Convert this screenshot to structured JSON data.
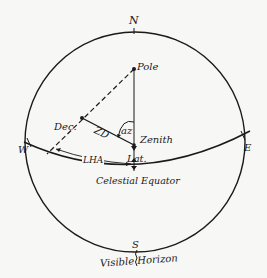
{
  "diagram": {
    "type": "celestial-sphere-navigational-triangle",
    "cardinal": {
      "north": "N",
      "south": "S",
      "west": "W",
      "east": "E"
    },
    "points": {
      "pole": "Pole",
      "zenith": "Zenith",
      "declination": "Dec.",
      "latitude": "Lat."
    },
    "arcs": {
      "zenith_distance": "ZD",
      "azimuth": "az",
      "local_hour_angle": "LHA"
    },
    "circles": {
      "equator": "Celestial Equator",
      "horizon": "Visible Horizon"
    },
    "colors": {
      "ink": "#1a1a1a",
      "paper": "#f7f7f5"
    }
  }
}
